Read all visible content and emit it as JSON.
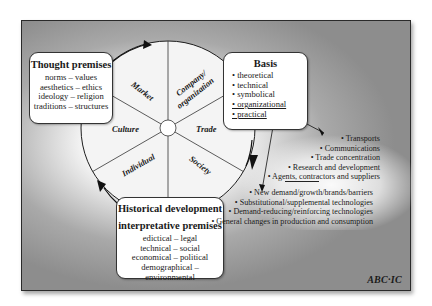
{
  "wheel": {
    "segments": [
      {
        "label": "Market"
      },
      {
        "label": "Company/"
      },
      {
        "label": "organization"
      },
      {
        "label": "Trade"
      },
      {
        "label": "Society"
      },
      {
        "label": "Individual"
      },
      {
        "label": "Culture"
      }
    ]
  },
  "thought_premises": {
    "title": "Thought premises",
    "lines": [
      "norms – values",
      "aesthetics – ethics",
      "ideology – religion",
      "traditions – structures"
    ]
  },
  "basis": {
    "title": "Basis",
    "items": [
      "• theoretical",
      "• technical",
      "• symbolical",
      "• organizational",
      "• practical"
    ]
  },
  "historical": {
    "title_line1": "Historical development",
    "title_line2": "interpretative premises",
    "lines": [
      "edictical – legal",
      "technical – social",
      "economical – political",
      "demographical – environmental"
    ]
  },
  "organizational_effects": [
    "• Transports",
    "• Communications",
    "• Trade concentration",
    "• Research and development",
    "• Agents, contractors and suppliers"
  ],
  "practical_effects": [
    "• New demand/growth/brands/barriers",
    "• Substitutional/supplemental technologies",
    "• Demand-reducing/reinforcing technologies",
    "• General changes in production and consumption"
  ],
  "logo": "ABC·IC",
  "colors": {
    "frame_gray": "#8d8d8d",
    "wheel_fill": "#f4f4f4",
    "line": "#222222"
  }
}
